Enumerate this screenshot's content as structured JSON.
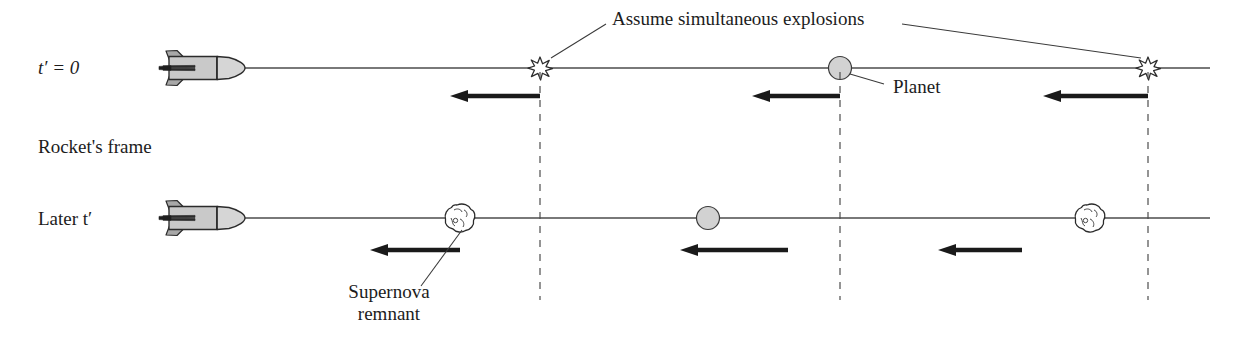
{
  "figure": {
    "frame_label": "Rocket's frame"
  },
  "rows": [
    {
      "id": "row-top",
      "time_label_html": "t' = 0",
      "time_label": "t′ = 0",
      "baseline_y": 68,
      "rocket": {
        "x": 165,
        "label": "rocket"
      },
      "events": [
        {
          "type": "explosion",
          "x": 540,
          "name": "explosion-left"
        },
        {
          "type": "planet",
          "x": 840,
          "name": "planet"
        },
        {
          "type": "explosion",
          "x": 1148,
          "name": "explosion-right"
        }
      ],
      "arrows": [
        {
          "tail_x": 540,
          "head_x": 450,
          "y": 96
        },
        {
          "tail_x": 840,
          "head_x": 752,
          "y": 96
        },
        {
          "tail_x": 1148,
          "head_x": 1043,
          "y": 96
        }
      ]
    },
    {
      "id": "row-bottom",
      "time_label_html": "Later t'",
      "time_label": "Later t′",
      "baseline_y": 218,
      "rocket": {
        "x": 165,
        "label": "rocket"
      },
      "events": [
        {
          "type": "remnant",
          "x": 460,
          "name": "supernova-remnant-left"
        },
        {
          "type": "planet",
          "x": 708,
          "name": "planet"
        },
        {
          "type": "remnant",
          "x": 1090,
          "name": "supernova-remnant-right"
        }
      ],
      "arrows": [
        {
          "tail_x": 460,
          "head_x": 370,
          "y": 250
        },
        {
          "tail_x": 788,
          "head_x": 680,
          "y": 250
        },
        {
          "tail_x": 1022,
          "head_x": 938,
          "y": 250
        }
      ]
    }
  ],
  "dashed_lines": [
    {
      "x": 540,
      "y1": 70,
      "y2": 300,
      "name": "worldline-left"
    },
    {
      "x": 840,
      "y1": 70,
      "y2": 300,
      "name": "worldline-middle"
    },
    {
      "x": 1148,
      "y1": 70,
      "y2": 300,
      "name": "worldline-right"
    }
  ],
  "annotations": {
    "simultaneous": {
      "text": "Assume simultaneous explosions",
      "x": 610,
      "y": 10,
      "leaders": [
        {
          "from_x": 611,
          "from_y": 26,
          "to_x": 551,
          "to_y": 57
        },
        {
          "from_x": 900,
          "from_y": 26,
          "to_x": 1141,
          "to_y": 58
        }
      ]
    },
    "planet": {
      "text": "Planet",
      "x": 890,
      "y": 78,
      "leader": {
        "from_x": 884,
        "from_y": 86,
        "to_x": 848,
        "to_y": 74
      }
    },
    "supernova": {
      "line1": "Supernova",
      "line2": "remnant",
      "x": 350,
      "y": 288,
      "leader": {
        "from_x": 420,
        "from_y": 286,
        "to_x": 463,
        "to_y": 228
      }
    }
  },
  "colors": {
    "ink": "#1c1c1c",
    "line": "#4d4d4d",
    "rocket_fill": "#c9c9c9",
    "rocket_nose_fill": "#d6d6d6",
    "rocket_fin_fill": "#a8a8a8",
    "planet_fill": "#d2d2d2",
    "explosion_fill": "#ffffff",
    "remnant_fill": "#ffffff",
    "arrow": "#1a1a1a",
    "dash": "#555555",
    "background": "#ffffff"
  }
}
